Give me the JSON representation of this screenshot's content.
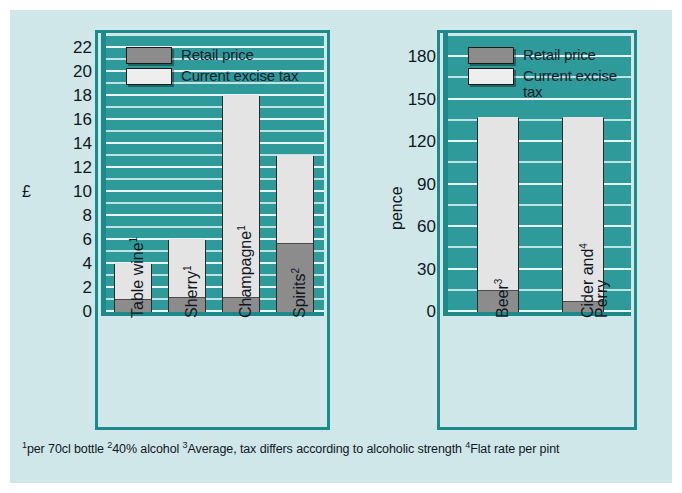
{
  "chart_data": [
    {
      "type": "bar",
      "id": "alcohol-price-tax-pounds",
      "title": "",
      "xlabel": "",
      "ylabel": "£",
      "ylim": [
        0,
        23
      ],
      "yticks": [
        0,
        2,
        4,
        6,
        8,
        10,
        12,
        14,
        16,
        18,
        20,
        22
      ],
      "grid": true,
      "stacked": true,
      "legend_position": "top-left",
      "categories": [
        "Table wine",
        "Sherry",
        "Champagne",
        "Spirits"
      ],
      "category_footnotes": [
        "1",
        "1",
        "1",
        "2"
      ],
      "series": [
        {
          "name": "Retail price",
          "values": [
            1.0,
            1.2,
            1.2,
            5.7
          ],
          "color": "#8c8c8c"
        },
        {
          "name": "Current excise tax",
          "values": [
            3.0,
            4.8,
            16.8,
            7.3
          ],
          "color": "#e4e4e4"
        }
      ],
      "totals": [
        4.0,
        6.0,
        18.0,
        13.0
      ]
    },
    {
      "type": "bar",
      "id": "alcohol-price-tax-pence",
      "title": "",
      "xlabel": "",
      "ylabel": "pence",
      "ylim": [
        0,
        195
      ],
      "yticks": [
        0,
        30,
        60,
        90,
        120,
        150,
        180
      ],
      "grid": true,
      "stacked": true,
      "legend_position": "top-left",
      "categories": [
        "Beer",
        "Cider and Perry"
      ],
      "category_footnotes": [
        "3",
        "4"
      ],
      "series": [
        {
          "name": "Retail price",
          "values": [
            15,
            7
          ],
          "color": "#8c8c8c"
        },
        {
          "name": "Current excise tax",
          "values": [
            122,
            130
          ],
          "color": "#e4e4e4"
        }
      ],
      "totals": [
        137,
        137
      ]
    }
  ],
  "left_chart": {
    "axis_title": "£",
    "yticks": [
      "22",
      "20",
      "18",
      "16",
      "14",
      "12",
      "10",
      "8",
      "6",
      "4",
      "2",
      "0"
    ],
    "legend": [
      {
        "label": "Retail price",
        "swatch": "retail-swatch"
      },
      {
        "label": "Current excise tax",
        "swatch": "tax-swatch"
      }
    ],
    "categories": [
      {
        "name": "Table wine",
        "note": "1"
      },
      {
        "name": "Sherry",
        "note": "1"
      },
      {
        "name": "Champagne",
        "note": "1"
      },
      {
        "name": "Spirits",
        "note": "2"
      }
    ]
  },
  "right_chart": {
    "axis_title": "pence",
    "yticks": [
      "180",
      "150",
      "120",
      "90",
      "60",
      "30",
      "0"
    ],
    "legend": [
      {
        "label": "Retail price",
        "swatch": "retail-swatch"
      },
      {
        "label": "Current excise",
        "label2": "tax",
        "swatch": "tax-swatch"
      }
    ],
    "categories": [
      {
        "name": "Beer",
        "note": "3",
        "line2": ""
      },
      {
        "name": "Cider and",
        "note": "4",
        "line2": "Perry"
      }
    ]
  },
  "footnotes": {
    "n1": "1",
    "t1": "per 70cl bottle ",
    "n2": "2",
    "t2": "40% alcohol ",
    "n3": "3",
    "t3": "Average, tax differs according to alcoholic strength ",
    "n4": "4",
    "t4": "Flat rate per pint"
  },
  "colors": {
    "page_background": "#cfe7e8",
    "plot_background": "#2e9a9a",
    "panel_border": "#1c8a8a",
    "retail": "#8c8c8c",
    "tax": "#e4e4e4",
    "gridline": "#bfe3e3"
  }
}
